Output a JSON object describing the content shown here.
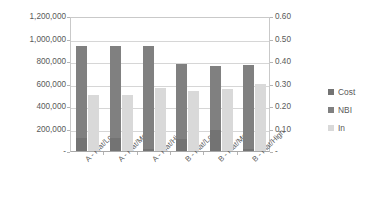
{
  "chart_data": {
    "type": "bar",
    "title": "",
    "subtitle": "",
    "xlabel": "",
    "ylabel": "",
    "categories": [
      "A - Flat/Low",
      "A - Flat/Med.",
      "A - Flat/High",
      "B - Flat/Low",
      "B - Flat/Med.",
      "B - Flat/High"
    ],
    "series": [
      {
        "name": "Cost",
        "axis": "left",
        "color": "#737373",
        "values": [
          115000,
          118000,
          15000,
          110000,
          185000,
          20000
        ]
      },
      {
        "name": "NBI",
        "axis": "left",
        "color": "#808080",
        "values": [
          935000,
          935000,
          935000,
          775000,
          760000,
          765000
        ]
      },
      {
        "name": "In",
        "axis": "right",
        "color": "#d9d9d9",
        "values": [
          0.25,
          0.25,
          0.28,
          0.265,
          0.275,
          0.3
        ]
      }
    ],
    "left_axis": {
      "ticks": [
        "-",
        "200,000",
        "400,000",
        "600,000",
        "800,000",
        "1,000,000",
        "1,200,000"
      ],
      "tick_values": [
        0,
        200000,
        400000,
        600000,
        800000,
        1000000,
        1200000
      ],
      "ylim": [
        0,
        1200000
      ]
    },
    "right_axis": {
      "ticks": [
        "-",
        "0.10",
        "0.20",
        "0.30",
        "0.40",
        "0.50",
        "0.60"
      ],
      "tick_values": [
        0,
        0.1,
        0.2,
        0.3,
        0.4,
        0.5,
        0.6
      ],
      "ylim": [
        0,
        0.6
      ]
    },
    "legend": {
      "position": "right",
      "entries": [
        {
          "label": "Cost",
          "color": "#737373"
        },
        {
          "label": "NBI",
          "color": "#808080"
        },
        {
          "label": "In",
          "color": "#d9d9d9"
        }
      ]
    },
    "grid": true,
    "plot_background": "#ffffff"
  }
}
